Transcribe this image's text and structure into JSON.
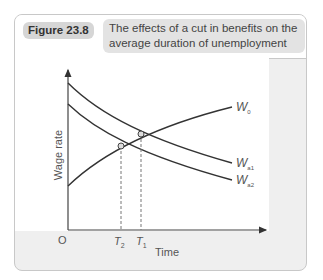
{
  "figure": {
    "label": "Figure 23.8",
    "title": "The effects of a cut in benefits on the average duration of unemployment"
  },
  "chart": {
    "ylabel": "Wage rate",
    "xlabel": "Time",
    "origin": "O",
    "curves": [
      {
        "name": "W0",
        "main": "W",
        "sub": "0"
      },
      {
        "name": "Wa1",
        "main": "W",
        "sub": "a1"
      },
      {
        "name": "Wa2",
        "main": "W",
        "sub": "a2"
      }
    ],
    "ticks": [
      {
        "main": "T",
        "sub": "2"
      },
      {
        "main": "T",
        "sub": "1"
      }
    ]
  },
  "colors": {
    "frame_bg": "#efefef",
    "label_bg": "#d6d6d6",
    "title_bg": "#e3e3e3",
    "curve": "#333333"
  }
}
